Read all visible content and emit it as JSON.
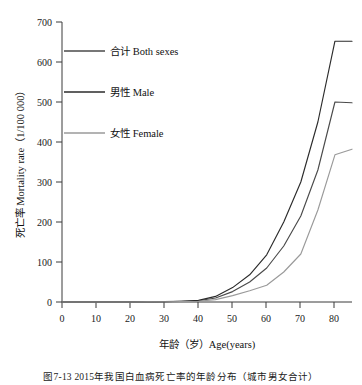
{
  "chart_data": {
    "type": "line",
    "title": "",
    "xlabel": "年龄（岁）Age(years)",
    "ylabel": "死亡率 Mortality rate（1/100 000）",
    "xlim": [
      0,
      85
    ],
    "ylim": [
      0,
      700
    ],
    "xticks": [
      0,
      10,
      20,
      30,
      40,
      50,
      60,
      70,
      80
    ],
    "yticks": [
      0,
      100,
      200,
      300,
      400,
      500,
      600,
      700
    ],
    "xtick_labels": [
      "0",
      "10",
      "20",
      "30",
      "40",
      "50",
      "60",
      "70",
      "80"
    ],
    "ytick_labels": [
      "0",
      "100",
      "200",
      "300",
      "400",
      "500",
      "600",
      "700"
    ],
    "grid": false,
    "legend_position": "upper-left-inside",
    "x": [
      0,
      5,
      10,
      15,
      20,
      25,
      30,
      35,
      40,
      45,
      50,
      55,
      60,
      65,
      70,
      75,
      80,
      85
    ],
    "series": [
      {
        "name": "合计 Both sexes",
        "color": "#4a4a4a",
        "values": [
          0,
          0,
          0,
          0,
          0,
          0.3,
          0.7,
          1.5,
          3,
          10,
          26,
          50,
          85,
          140,
          215,
          330,
          500,
          498
        ]
      },
      {
        "name": "男性 Male",
        "color": "#2b2b2b",
        "values": [
          0,
          0,
          0,
          0,
          0,
          0.4,
          0.9,
          2,
          4,
          14,
          36,
          68,
          118,
          200,
          300,
          450,
          652,
          652
        ]
      },
      {
        "name": "女性 Female",
        "color": "#9a9a9a",
        "values": [
          0,
          0,
          0,
          0,
          0,
          0.2,
          0.5,
          1,
          2,
          6,
          16,
          28,
          42,
          75,
          120,
          230,
          368,
          382
        ]
      }
    ]
  },
  "legend": {
    "items": [
      {
        "label": "合计 Both sexes",
        "color": "#4a4a4a"
      },
      {
        "label": "男性 Male",
        "color": "#2b2b2b"
      },
      {
        "label": "女性 Female",
        "color": "#9a9a9a"
      }
    ]
  },
  "axes": {
    "x_title": "年龄（岁）Age(years)",
    "y_title": "死亡率 Mortality rate（1/100 000）"
  },
  "caption": {
    "text": "图7-13  2015年我国白血病死亡率的年龄分布（城市男女合计）"
  }
}
